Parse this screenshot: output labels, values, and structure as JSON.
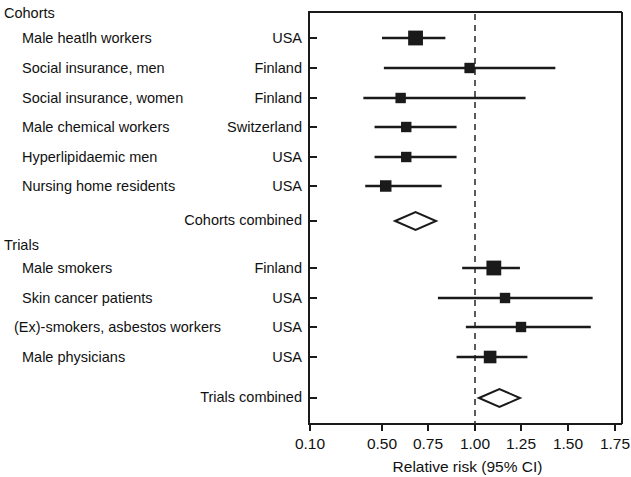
{
  "figure": {
    "type": "forest-plot",
    "group_headers": [
      "Cohorts",
      "Trials"
    ],
    "summary_labels": {
      "cohorts": "Cohorts combined",
      "trials": "Trials combined"
    }
  },
  "axis": {
    "title": "Relative risk (95% CI)",
    "ticks": [
      "0.10",
      "0.50",
      "0.75",
      "1.00",
      "1.25",
      "1.50",
      "1.75"
    ],
    "tick_values": [
      0.1,
      0.5,
      0.75,
      1.0,
      1.25,
      1.5,
      1.75
    ],
    "reference_line": 1.0,
    "min": 0.1,
    "max": 1.75
  },
  "chart_data": {
    "type": "forest",
    "title": "",
    "xlabel": "Relative risk (95% CI)",
    "ylabel": "",
    "xlim": [
      0.1,
      1.75
    ],
    "xticks": [
      0.1,
      0.5,
      0.75,
      1.0,
      1.25,
      1.5,
      1.75
    ],
    "xtick_labels": [
      "0.10",
      "0.50",
      "0.75",
      "1.00",
      "1.25",
      "1.50",
      "1.75"
    ],
    "reference_line": 1.0,
    "grid": false,
    "legend": "none",
    "groups": [
      {
        "name": "Cohorts",
        "studies": [
          {
            "label": "Male heatlh workers",
            "country": "USA",
            "rr": 0.68,
            "ci_low": 0.5,
            "ci_high": 0.84,
            "marker_size": 4
          },
          {
            "label": "Social insurance, men",
            "country": "Finland",
            "rr": 0.97,
            "ci_low": 0.51,
            "ci_high": 1.43,
            "marker_size": 2
          },
          {
            "label": "Social insurance, women",
            "country": "Finland",
            "rr": 0.6,
            "ci_low": 0.4,
            "ci_high": 1.27,
            "marker_size": 2
          },
          {
            "label": "Male chemical workers",
            "country": "Switzerland",
            "rr": 0.63,
            "ci_low": 0.46,
            "ci_high": 0.9,
            "marker_size": 2
          },
          {
            "label": "Hyperlipidaemic men",
            "country": "USA",
            "rr": 0.63,
            "ci_low": 0.46,
            "ci_high": 0.9,
            "marker_size": 2
          },
          {
            "label": "Nursing home residents",
            "country": "USA",
            "rr": 0.52,
            "ci_low": 0.41,
            "ci_high": 0.82,
            "marker_size": 2.5
          }
        ],
        "summary": {
          "label": "Cohorts combined",
          "rr": 0.68,
          "ci_low": 0.57,
          "ci_high": 0.79
        }
      },
      {
        "name": "Trials",
        "studies": [
          {
            "label": "Male smokers",
            "country": "Finland",
            "rr": 1.1,
            "ci_low": 0.93,
            "ci_high": 1.24,
            "marker_size": 4
          },
          {
            "label": "Skin cancer patients",
            "country": "USA",
            "rr": 1.16,
            "ci_low": 0.8,
            "ci_high": 1.63,
            "marker_size": 2
          },
          {
            "label": "(Ex)-smokers, asbestos workers",
            "country": "USA",
            "rr": 1.25,
            "ci_low": 0.95,
            "ci_high": 1.62,
            "marker_size": 2
          },
          {
            "label": "Male physicians",
            "country": "USA",
            "rr": 1.08,
            "ci_low": 0.9,
            "ci_high": 1.28,
            "marker_size": 3
          }
        ],
        "summary": {
          "label": "Trials combined",
          "rr": 1.13,
          "ci_low": 1.02,
          "ci_high": 1.24
        }
      }
    ]
  },
  "colors": {
    "marker": "#1a1a1a",
    "line": "#1a1a1a",
    "frame": "#1a1a1a",
    "reference": "#333333",
    "text": "#111111",
    "background": "#ffffff"
  }
}
